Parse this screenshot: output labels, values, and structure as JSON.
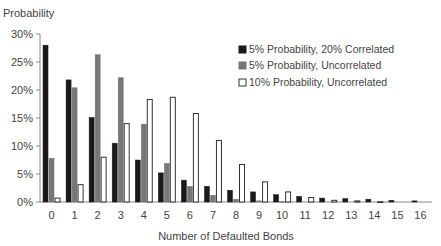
{
  "chart_data": {
    "type": "bar",
    "title": "",
    "ylabel": "Probability",
    "xlabel": "Number of Defaulted Bonds",
    "ylim": [
      0,
      30
    ],
    "yticks": [
      "0%",
      "5%",
      "10%",
      "15%",
      "20%",
      "25%",
      "30%"
    ],
    "grid": false,
    "legend_position": "upper right",
    "categories": [
      "0",
      "1",
      "2",
      "3",
      "4",
      "5",
      "6",
      "7",
      "8",
      "9",
      "10",
      "11",
      "12",
      "13",
      "14",
      "15",
      "16"
    ],
    "series": [
      {
        "name": "5% Probability, 20% Correlated",
        "color": "#1a1a1a",
        "values": [
          28.0,
          21.8,
          15.1,
          10.5,
          7.5,
          5.2,
          3.9,
          2.8,
          2.1,
          1.8,
          1.3,
          1.0,
          0.7,
          0.6,
          0.5,
          0.3,
          0.2
        ]
      },
      {
        "name": "5% Probability, Uncorrelated",
        "color": "#777777",
        "values": [
          7.8,
          20.4,
          26.3,
          22.2,
          13.9,
          6.9,
          2.8,
          1.2,
          0.5,
          0.2,
          0.05,
          0.0,
          0.0,
          0.0,
          0.0,
          0.0,
          0.0
        ]
      },
      {
        "name": "10% Probability, Uncorrelated",
        "color": "#ffffff",
        "values": [
          0.7,
          3.1,
          8.0,
          14.0,
          18.3,
          18.7,
          15.8,
          11.0,
          6.7,
          3.6,
          1.8,
          0.8,
          0.3,
          0.2,
          0.05,
          0.0,
          0.0
        ]
      }
    ]
  }
}
